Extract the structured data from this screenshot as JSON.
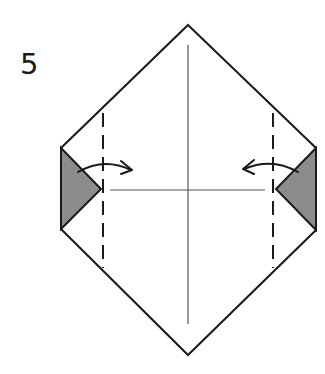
{
  "step": {
    "number": "5"
  },
  "diagram": {
    "outline": {
      "top": [
        188,
        25
      ],
      "right_top": [
        316,
        148
      ],
      "right_bottom": [
        316,
        230
      ],
      "bottom": [
        188,
        355
      ],
      "left_bottom": [
        61,
        229
      ],
      "left_top": [
        61,
        148
      ]
    },
    "center_crease_vertical": {
      "x": 188,
      "y1": 45,
      "y2": 324
    },
    "center_crease_horizontal": {
      "y": 190,
      "x1": 110,
      "x2": 265
    },
    "left_flap": {
      "points": [
        [
          61,
          148
        ],
        [
          101,
          189
        ],
        [
          61,
          229
        ]
      ],
      "fill": "#8c8c8c"
    },
    "right_flap": {
      "points": [
        [
          316,
          148
        ],
        [
          276,
          189
        ],
        [
          316,
          230
        ]
      ],
      "fill": "#8c8c8c"
    },
    "left_fold_line": {
      "x": 103,
      "y1": 113,
      "y2": 268,
      "style": "dashed"
    },
    "right_fold_line": {
      "x": 273,
      "y1": 113,
      "y2": 268,
      "style": "dashed"
    },
    "left_arrow": {
      "direction": "right",
      "meaning": "fold flap inward"
    },
    "right_arrow": {
      "direction": "left",
      "meaning": "fold flap inward"
    },
    "colors": {
      "line": "#1a1a1a",
      "crease": "#555555",
      "flap": "#8c8c8c"
    }
  }
}
